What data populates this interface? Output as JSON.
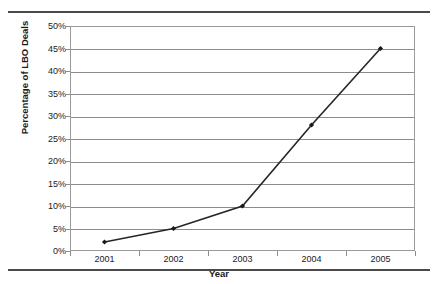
{
  "page": {
    "clipped_title": "",
    "rule_color": "#4a4a4a"
  },
  "chart_data": {
    "type": "line",
    "title": "",
    "xlabel": "Year",
    "ylabel": "Percentage of LBO Deals",
    "categories": [
      "2001",
      "2002",
      "2003",
      "2004",
      "2005"
    ],
    "values": [
      2,
      5,
      10,
      28,
      45
    ],
    "ytick_labels": [
      "0%",
      "5%",
      "10%",
      "15%",
      "20%",
      "25%",
      "30%",
      "35%",
      "40%",
      "45%",
      "50%"
    ],
    "ytick_values": [
      0,
      5,
      10,
      15,
      20,
      25,
      30,
      35,
      40,
      45,
      50
    ],
    "ylim": [
      0,
      50
    ],
    "ytick_step": 5,
    "grid": "horizontal",
    "legend": "none",
    "series": [
      {
        "name": "Percentage of LBO Deals",
        "values": [
          2,
          5,
          10,
          28,
          45
        ],
        "line_color": "#262626",
        "marker": "diamond",
        "marker_color": "#1a1a1a"
      }
    ],
    "gridline_color": "#8c8c8c",
    "plot_border_color": "#9a9a9a"
  }
}
